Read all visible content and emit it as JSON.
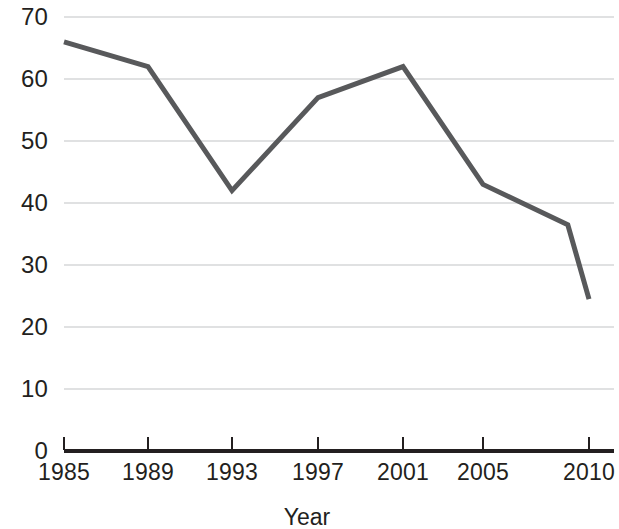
{
  "chart_data": {
    "type": "line",
    "title": "",
    "subtitle": "",
    "xlabel": "Year",
    "ylabel": "",
    "x": [
      1985,
      1989,
      1993,
      1997,
      2001,
      2005,
      2009,
      2010
    ],
    "values": [
      66,
      62,
      42,
      57,
      62,
      43,
      36.5,
      24.5
    ],
    "series": [
      {
        "name": "",
        "values": [
          66,
          62,
          42,
          57,
          62,
          43,
          36.5,
          24.5
        ]
      }
    ],
    "x_tick_values": [
      1985,
      1989,
      1993,
      1997,
      2001,
      2005,
      2010
    ],
    "x_tick_labels": [
      "1985",
      "1989",
      "1993",
      "1997",
      "2001",
      "2005",
      "2010"
    ],
    "y_tick_values": [
      0,
      10,
      20,
      30,
      40,
      50,
      60,
      70
    ],
    "y_tick_labels": [
      "0",
      "10",
      "20",
      "30",
      "40",
      "50",
      "60",
      "70"
    ],
    "xlim": [
      1985,
      2010
    ],
    "ylim": [
      0,
      70
    ],
    "grid": "horizontal",
    "legend": "none",
    "line_color": "#58595b",
    "grid_color": "#d6d7d8",
    "axis_color": "#231f20",
    "line_width": 5,
    "annotations": []
  },
  "layout": {
    "plot_left_px": 64,
    "plot_right_px": 614,
    "axis_y_px": 451,
    "y_unit_px": 6.2,
    "x_tick_px": [
      64,
      148,
      232,
      318,
      403,
      483,
      589
    ]
  }
}
